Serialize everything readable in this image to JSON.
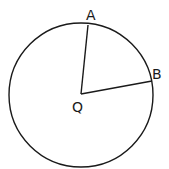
{
  "diagram": {
    "type": "circle-with-radii",
    "circle": {
      "center": {
        "x": 81,
        "y": 95
      },
      "radius": 72,
      "stroke_color": "#1a1a1a"
    },
    "center_point": {
      "label": "Q",
      "x": 81,
      "y": 94,
      "label_x": 72,
      "label_y": 112
    },
    "points": [
      {
        "label": "A",
        "x": 88,
        "y": 25,
        "label_x": 86,
        "label_y": 20
      },
      {
        "label": "B",
        "x": 152,
        "y": 81,
        "label_x": 152,
        "label_y": 79
      }
    ],
    "segments": [
      {
        "from": "Q",
        "to": "A"
      },
      {
        "from": "Q",
        "to": "B"
      }
    ]
  }
}
